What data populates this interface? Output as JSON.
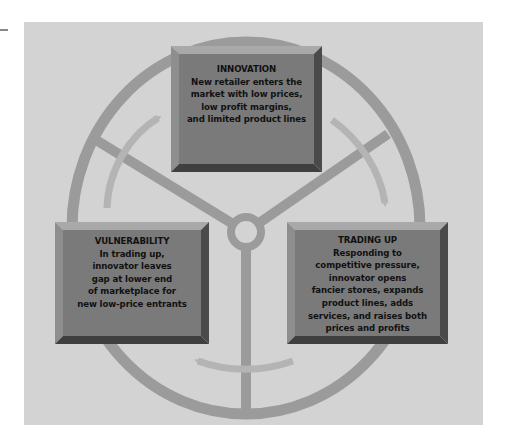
{
  "diagram": {
    "type": "cycle",
    "topic": "Wheel of retailing",
    "colors": {
      "background_panel": "#d3d3d3",
      "wheel": "#9b9b9b",
      "arrow": "#b4b4b4",
      "box_face": "#7a7a7a",
      "box_bevel_light": "#a9a9a9",
      "box_bevel_dark": "#3f3f3f",
      "text": "#111111"
    },
    "stages": [
      {
        "id": "innovation",
        "title": "INNOVATION",
        "lines": [
          "New retailer enters the",
          "market with low prices,",
          "low profit margins,",
          "and limited product lines"
        ]
      },
      {
        "id": "trading-up",
        "title": "TRADING UP",
        "lines": [
          "Responding to",
          "competitive pressure,",
          "innovator opens",
          "fancier stores, expands",
          "product lines, adds",
          "services, and raises both",
          "prices and profits"
        ]
      },
      {
        "id": "vulnerability",
        "title": "VULNERABILITY",
        "lines": [
          "In trading up,",
          "innovator leaves",
          "gap at lower end",
          "of marketplace for",
          "new low-price entrants"
        ]
      }
    ],
    "flow": [
      "innovation",
      "trading-up",
      "vulnerability",
      "innovation"
    ]
  }
}
